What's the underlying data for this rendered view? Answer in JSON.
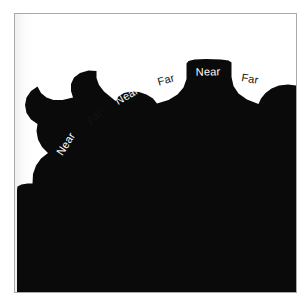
{
  "figure": {
    "title": "",
    "background_color": "#ffffff",
    "frame_color": "#a9a9a9",
    "shape_color": "#0a0a0a",
    "near_label_color": "#ffffff",
    "far_label_color": "#141414",
    "plate": {
      "x": 14,
      "y": 13,
      "width": 283,
      "height": 280
    },
    "labels": [
      {
        "id": "near-1",
        "text": "Near",
        "kind": "near",
        "x": 66,
        "y": 144,
        "rotation": -57
      },
      {
        "id": "far-1",
        "text": "Far",
        "kind": "far",
        "x": 95,
        "y": 117,
        "rotation": -46
      },
      {
        "id": "near-2",
        "text": "Near",
        "kind": "near",
        "x": 127,
        "y": 96,
        "rotation": -30
      },
      {
        "id": "far-2",
        "text": "Far",
        "kind": "far",
        "x": 166,
        "y": 80,
        "rotation": -16
      },
      {
        "id": "near-3",
        "text": "Near",
        "kind": "near",
        "x": 208,
        "y": 72,
        "rotation": -1
      },
      {
        "id": "far-3",
        "text": "Far",
        "kind": "far",
        "x": 250,
        "y": 79,
        "rotation": 9
      }
    ],
    "silhouette_path": "M 258.5 292 L 296 292 L 296 85.5 L 288 84.5 L 279 85.5 L 271.5 88.5 L 265.5 93 L 261 98.5 L 258.5 104 L 247 99.5 L 238.5 93.5 L 233.5 86 L 231.5 77 L 231.5 62.5 L 228.5 60.5 L 221 59.5 L 206 59 L 194.5 59.5 L 188.5 61 L 186.5 63.5 L 186.5 79 L 183.5 87.5 L 177.5 94.5 L 168.5 100 L 157 103.5 L 153 98.5 L 146.5 94.5 L 139 92 L 131 91.5 L 124 93 L 118.5 96.5 L 115.5 101 L 104 91.5 L 99 85 L 96.5 78 L 96.5 71 L 88.5 70.5 L 80 73 L 74 77.5 L 71 84 L 71 91 L 73 97.5 L 62.5 100 L 53.5 100 L 46.5 97.5 L 41 93 L 37.5 86.5 L 31 91 L 26.5 97.5 L 25 105 L 26.5 113 L 31 119.5 L 37.5 124 L 36.5 131 L 38 139.5 L 42 147 L 48 153 L 41 158.5 L 36 165.5 L 33 174 L 32.5 183.5 L 27.5 183.5 L 21.5 184.5 L 17.5 186.5 L 17 190 L 17 292 L 258.5 292 Z"
  }
}
